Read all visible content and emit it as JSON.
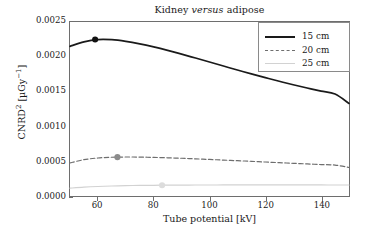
{
  "chart_data": {
    "type": "line",
    "title": "Kidney versus adipose",
    "title_parts": {
      "pre": "Kidney ",
      "italic": "versus",
      "post": " adipose"
    },
    "xlabel": "Tube potential  [kV]",
    "ylabel": "CNRD²  [µGy⁻¹]",
    "ylabel_parts": {
      "base": "CNRD",
      "exp": "2",
      "unit_open": "  [µGy",
      "unit_exp": "−1",
      "unit_close": "]"
    },
    "xlim": [
      50,
      150
    ],
    "ylim": [
      0.0,
      0.0025
    ],
    "xticks": [
      60,
      80,
      100,
      120,
      140
    ],
    "yticks": [
      0.0,
      0.0005,
      0.001,
      0.0015,
      0.002,
      0.0025
    ],
    "ytick_labels": [
      "0.0000",
      "0.0005",
      "0.0010",
      "0.0015",
      "0.0020",
      "0.0025"
    ],
    "xtick_labels": [
      "60",
      "80",
      "100",
      "120",
      "140"
    ],
    "grid": false,
    "legend_position": "upper right",
    "x": [
      50,
      55,
      60,
      65,
      70,
      75,
      80,
      85,
      90,
      95,
      100,
      105,
      110,
      115,
      120,
      125,
      130,
      135,
      140,
      145,
      150
    ],
    "series": [
      {
        "name": "15 cm",
        "label": "15 cm",
        "color": "#1a1a1a",
        "style": "solid",
        "values": [
          0.00215,
          0.002215,
          0.002248,
          0.002246,
          0.002222,
          0.002186,
          0.002142,
          0.002092,
          0.002038,
          0.001982,
          0.001925,
          0.001867,
          0.00181,
          0.001754,
          0.0017,
          0.001648,
          0.001598,
          0.001551,
          0.001506,
          0.001464,
          0.00133
        ],
        "marker": {
          "x": 59,
          "y": 0.002248,
          "filled": true,
          "color": "#111111"
        }
      },
      {
        "name": "20 cm",
        "label": "20 cm",
        "color": "#6e6e6e",
        "style": "dashed",
        "values": [
          0.000475,
          0.000522,
          0.000546,
          0.000557,
          0.00056,
          0.000559,
          0.000555,
          0.000549,
          0.000542,
          0.000534,
          0.000525,
          0.000516,
          0.000507,
          0.000498,
          0.000488,
          0.000479,
          0.00047,
          0.000461,
          0.000452,
          0.000444,
          0.00041
        ],
        "marker": {
          "x": 67,
          "y": 0.000558,
          "filled": true,
          "color": "#8c8c8c"
        }
      },
      {
        "name": "25 cm",
        "label": "25 cm",
        "color": "#d2d2d2",
        "style": "solid",
        "values": [
          0.000112,
          0.000127,
          0.000137,
          0.000144,
          0.000149,
          0.000152,
          0.000154,
          0.000156,
          0.000157,
          0.000158,
          0.000158,
          0.000159,
          0.000159,
          0.000159,
          0.000159,
          0.000159,
          0.000159,
          0.000159,
          0.000159,
          0.000158,
          0.000158
        ],
        "marker": {
          "x": 83,
          "y": 0.000155,
          "filled": true,
          "color": "#dcdcdc"
        }
      }
    ]
  }
}
